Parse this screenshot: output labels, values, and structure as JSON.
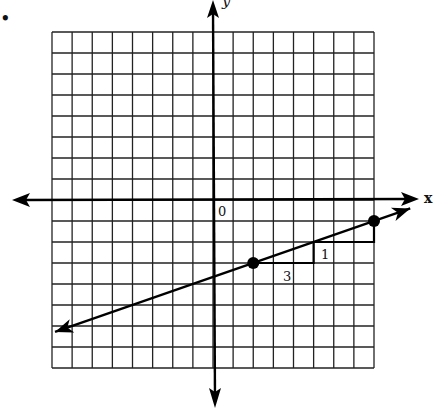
{
  "chart_data": {
    "type": "line",
    "title": "",
    "xlabel": "x",
    "ylabel": "y",
    "origin_label": "0",
    "xlim": [
      -8,
      8
    ],
    "ylim": [
      -8,
      8
    ],
    "grid": true,
    "grid_step": 1,
    "series": [
      {
        "name": "line",
        "equation": "y = (1/3)x - 11/3",
        "slope": 0.3333,
        "intercept": -3.6667,
        "x": [
          -7.85,
          9.8
        ],
        "y": [
          -6.28,
          -0.4
        ]
      }
    ],
    "points": [
      {
        "x": 2,
        "y": -3
      },
      {
        "x": 8,
        "y": -1
      }
    ],
    "slope_triangles": [
      {
        "from": [
          2,
          -3
        ],
        "run": 3,
        "rise": 1,
        "run_label": "3",
        "rise_label": "1"
      },
      {
        "from": [
          5,
          -2
        ],
        "run": 3,
        "rise": 1
      }
    ],
    "annotations": {
      "run_label": "3",
      "rise_label": "1"
    },
    "bullet": "•"
  }
}
